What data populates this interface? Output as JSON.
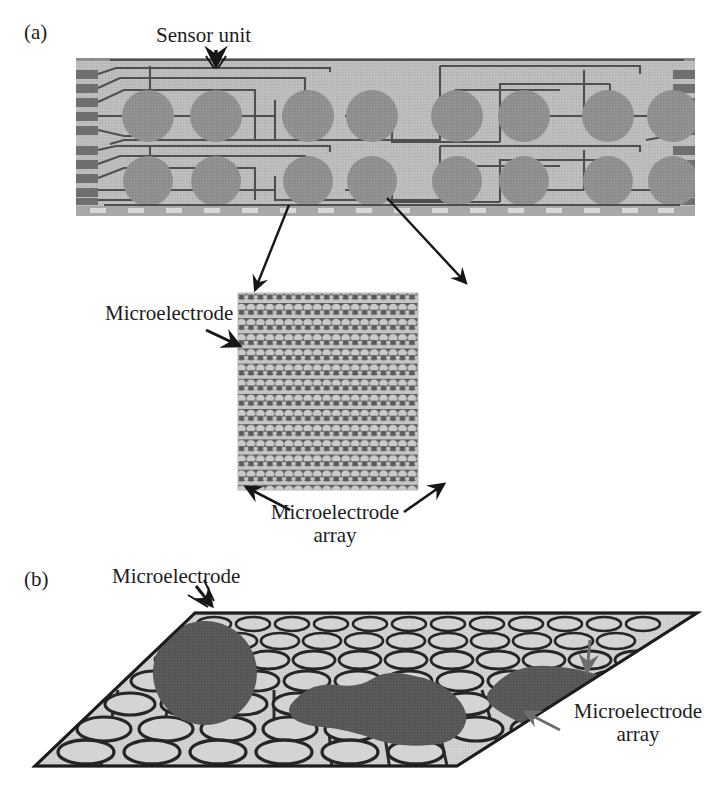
{
  "figure": {
    "width": 722,
    "height": 799,
    "background": "#ffffff",
    "caption_style": "serif",
    "panels": [
      {
        "tag": "(a)",
        "description": "Top view photograph-style schematic of a sensor chip with two rows of eight circular sensor units and wiring traces leading to edge contact pads, plus a magnified microelectrode array inset"
      },
      {
        "tag": "(b)",
        "description": "Perspective 3D drawing of the microelectrode array plate with elliptical microelectrodes and dark adherent cells on top"
      }
    ]
  },
  "labels": {
    "panel_a": "(a)",
    "panel_b": "(b)",
    "sensor_unit": "Sensor unit",
    "microelectrode": "Microelectrode",
    "microelectrode_array_line1": "Microelectrode",
    "microelectrode_array_line2": "array",
    "microelectrode_array": "Microelectrode array"
  },
  "colors": {
    "chip_substrate": "#b4b4b4",
    "chip_substrate_light": "#c0c0c0",
    "sensor_circle": "#8d8d8d",
    "trace_line": "#4a4a4a",
    "contact_pad": "#6a6a6a",
    "array_electrode_light": "#c8c8c8",
    "array_band_dark": "#5a5a5a",
    "plate_fill": "#cfcfcf",
    "electrode_fill": "#d2d2d2",
    "electrode_outline": "#2b2b2b",
    "cell_fill": "#585858",
    "arrow_dark": "#1a1a1a",
    "arrow_gray": "#6d6d6d",
    "text": "#1c1c1c"
  },
  "chip": {
    "bounds": {
      "x": 76,
      "y": 58,
      "width": 619,
      "height": 158
    },
    "rows": 2,
    "units_per_row": 8,
    "group_size": 4,
    "contact_pads_left": 6,
    "contact_pads_right": 6,
    "sensor_unit_pointer_target_index": 1
  },
  "array_inset": {
    "bounds": {
      "x": 238,
      "y": 293,
      "width": 180,
      "height": 197
    },
    "electrode_rows": 13,
    "electrodes_per_row": 19
  },
  "plate_b": {
    "corners": [
      [
        35,
        766
      ],
      [
        195,
        613
      ],
      [
        697,
        613
      ],
      [
        457,
        766
      ]
    ],
    "electrode_rows": 7,
    "cells": 3
  }
}
